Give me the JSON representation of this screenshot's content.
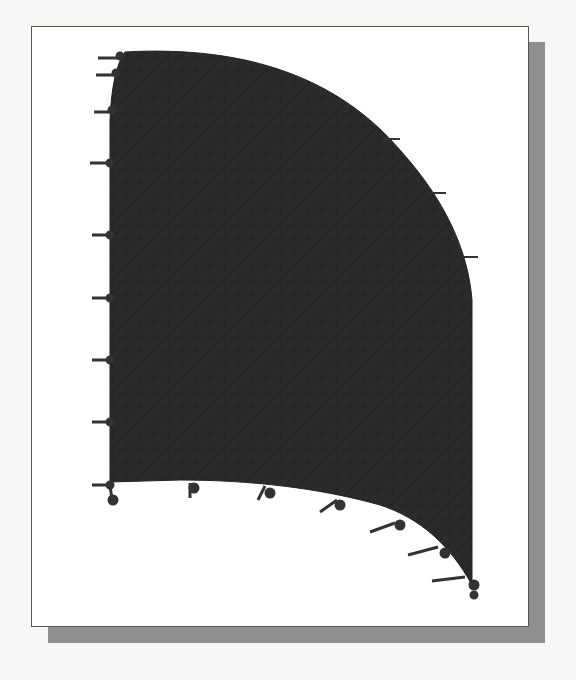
{
  "figure": {
    "bleed_through_text": "... ysis of pa... 2",
    "colors": {
      "mesh_fill": "#2b2b2b",
      "arrow": "#333333",
      "frame_border": "#555555",
      "shadow": "#8f8f8f",
      "page": "#f7f7f5"
    },
    "left_edge_arrows": 9,
    "right_arc_arrows": 3,
    "bottom_arc_arrows": 7
  }
}
